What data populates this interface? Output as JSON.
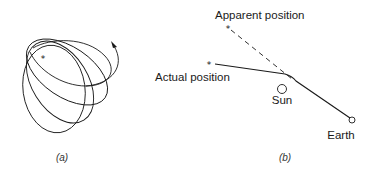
{
  "panel_a": {
    "caption": "(a)",
    "star_glyph": "*",
    "description": "Precessing elliptical orbit around a star",
    "orbit_count": 4
  },
  "panel_b": {
    "caption": "(b)",
    "labels": {
      "apparent_position": "Apparent position",
      "actual_position": "Actual position",
      "sun": "Sun",
      "earth": "Earth"
    },
    "star_glyph": "*",
    "description": "Deflection of starlight by the Sun"
  },
  "colors": {
    "line": "#1a1a1a",
    "background": "#ffffff"
  }
}
